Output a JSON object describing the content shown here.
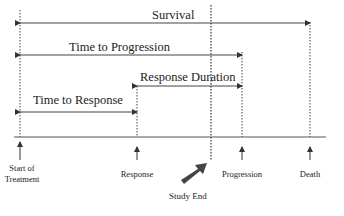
{
  "intervals": [
    {
      "label": "Survival"
    },
    {
      "label": "Time to Progression"
    },
    {
      "label": "Response Duration"
    },
    {
      "label": "Time to Response"
    }
  ],
  "events": [
    {
      "label": "Start of Treatment",
      "line1": "Start of",
      "line2": "Treatment"
    },
    {
      "label": "Response"
    },
    {
      "label": "Progression"
    },
    {
      "label": "Death"
    }
  ],
  "study_end": {
    "label": "Study End"
  }
}
